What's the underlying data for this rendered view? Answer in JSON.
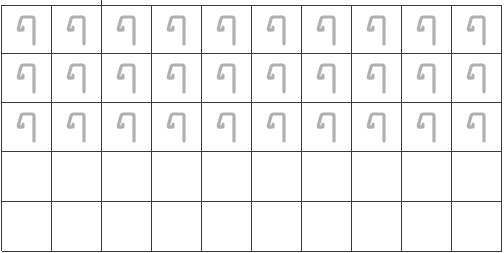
{
  "worksheet": {
    "columns": 10,
    "rows": [
      {
        "cells": [
          "trace",
          "trace",
          "trace",
          "trace",
          "trace",
          "trace",
          "trace",
          "trace",
          "trace",
          "trace"
        ]
      },
      {
        "cells": [
          "trace",
          "trace",
          "trace",
          "trace",
          "trace",
          "trace",
          "trace",
          "trace",
          "trace",
          "trace"
        ]
      },
      {
        "cells": [
          "trace",
          "trace",
          "trace",
          "trace",
          "trace",
          "trace",
          "trace",
          "trace",
          "trace",
          "trace"
        ]
      },
      {
        "cells": [
          "empty",
          "empty",
          "empty",
          "empty",
          "empty",
          "empty",
          "empty",
          "empty",
          "empty",
          "empty"
        ]
      },
      {
        "cells": [
          "empty",
          "empty",
          "empty",
          "empty",
          "empty",
          "empty",
          "empty",
          "empty",
          "empty",
          "empty"
        ]
      }
    ],
    "glyph_icon": "hook-letter-glyph",
    "colors": {
      "grid_line": "#3a3a3a",
      "trace_glyph": "#b0b0b0",
      "background": "#ffffff"
    }
  }
}
